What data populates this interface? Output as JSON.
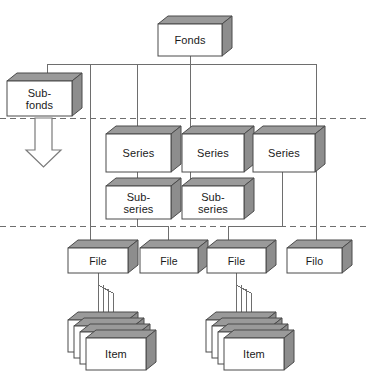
{
  "diagram": {
    "type": "hierarchy-tree",
    "levels": [
      {
        "id": "fonds",
        "label": "Fonds"
      },
      {
        "id": "subfonds",
        "label": "Sub-fonds"
      },
      {
        "id": "series",
        "label": "Series"
      },
      {
        "id": "subseries",
        "label": "Sub-series"
      },
      {
        "id": "file",
        "label": "File"
      },
      {
        "id": "item",
        "label": "Item"
      }
    ],
    "colors": {
      "box_face": "#ffffff",
      "box_top": "#9a9a9a",
      "box_side": "#8d8d8d",
      "outline": "#4a4a4a",
      "connector": "#6e6e6e",
      "dashed_rule": "#6e6e6e",
      "text": "#1a1a1a",
      "background": "#ffffff"
    },
    "nodes": {
      "fonds": {
        "label": "Fonds"
      },
      "subfonds": {
        "label": "Sub-\nfonds"
      },
      "series_1": {
        "label": "Series"
      },
      "series_2": {
        "label": "Series"
      },
      "series_3": {
        "label": "Series"
      },
      "subseries_1": {
        "label": "Sub-\nseries"
      },
      "subseries_2": {
        "label": "Sub-\nseries"
      },
      "file_1": {
        "label": "File"
      },
      "file_2": {
        "label": "File"
      },
      "file_3": {
        "label": "File"
      },
      "file_4": {
        "label": "Filo"
      },
      "item_stack_1": {
        "label": "Item",
        "count": 4
      },
      "item_stack_2": {
        "label": "Item",
        "count": 4
      }
    },
    "rules": [
      {
        "id": "rule-upper",
        "y": 118
      },
      {
        "id": "rule-lower",
        "y": 226
      }
    ],
    "arrow": {
      "id": "subfonds-down-arrow",
      "direction": "down"
    }
  }
}
